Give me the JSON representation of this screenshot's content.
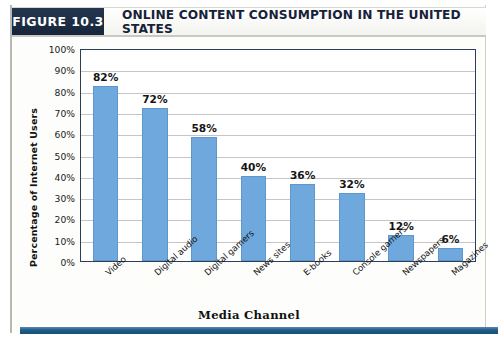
{
  "header": {
    "badge": "FIGURE 10.3",
    "title": "ONLINE CONTENT CONSUMPTION IN THE UNITED STATES"
  },
  "colors": {
    "bar": "#6ea8dd",
    "badge_bg": "#1b2b44",
    "plot_border": "#2d3f58",
    "gridline": "#c5c5c5",
    "bottom_rule": "#1f5c8a"
  },
  "chart_data": {
    "type": "bar",
    "title": "ONLINE CONTENT CONSUMPTION IN THE UNITED STATES",
    "xlabel": "Media Channel",
    "ylabel": "Percentage of Internet Users",
    "ylim": [
      0,
      100
    ],
    "ytick_labels": [
      "100%",
      "90%",
      "80%",
      "70%",
      "60%",
      "50%",
      "40%",
      "30%",
      "20%",
      "10%",
      "0%"
    ],
    "ytick_values": [
      100,
      90,
      80,
      70,
      60,
      50,
      40,
      30,
      20,
      10,
      0
    ],
    "grid": true,
    "legend": null,
    "categories": [
      "Video",
      "Digital audio",
      "Digital gamers",
      "News sites",
      "E-books",
      "Console gamers",
      "Newspapers",
      "Magazines"
    ],
    "values": [
      82,
      72,
      58,
      40,
      36,
      32,
      12,
      6
    ],
    "data_labels": [
      "82%",
      "72%",
      "58%",
      "40%",
      "36%",
      "32%",
      "12%",
      "6%"
    ]
  }
}
